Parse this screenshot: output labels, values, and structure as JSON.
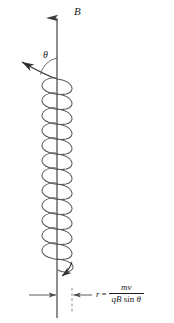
{
  "figure": {
    "field_label": "B",
    "angle_label": "θ",
    "radius_formula": {
      "variable": "r",
      "equals": "=",
      "numerator": "mv",
      "denominator_symbols": "qB",
      "denominator_function": "sin",
      "denominator_angle": "θ"
    },
    "colors": {
      "stroke": "#4a4a4a",
      "axis": "#3c3c3c",
      "text": "#1c1c1c",
      "background": "#ffffff"
    },
    "geometry": {
      "axis_x": 57,
      "axis_top_y": 8,
      "axis_bottom_y": 318,
      "dashed_x": 72,
      "dashed_top_y": 288,
      "dashed_bottom_y": 312,
      "helix_left_x": 42,
      "helix_right_x": 73,
      "helix_top_y": 82,
      "helix_bottom_y": 275,
      "helix_turns": 13,
      "radius_dimension_y": 295
    },
    "elements": {
      "field_arrow": "magnetic-field-vector",
      "velocity_arrow": "velocity-vector",
      "angle_arc": "angle-arc",
      "helix": "particle-helical-path",
      "helix_arrow": "helix-direction-arrow",
      "dimension_left_arrow": "radius-dimension-left-arrow",
      "dimension_right_arrow": "radius-dimension-right-arrow"
    }
  }
}
